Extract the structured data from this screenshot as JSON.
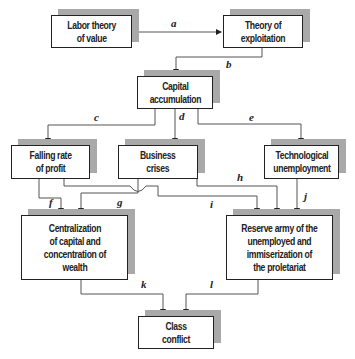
{
  "diagram": {
    "nodes": [
      {
        "id": "labor",
        "label": "Labor theory\nof value"
      },
      {
        "id": "exploitation",
        "label": "Theory of\nexploitation"
      },
      {
        "id": "capital",
        "label": "Capital\naccumulation"
      },
      {
        "id": "falling",
        "label": "Falling rate\nof profit"
      },
      {
        "id": "crises",
        "label": "Business\ncrises"
      },
      {
        "id": "tech",
        "label": "Technological\nunemployment"
      },
      {
        "id": "central",
        "label": "Centralization\nof capital and\nconcentration of\nwealth"
      },
      {
        "id": "reserve",
        "label": "Reserve army of the\nunemployed and\nimmiserization of\nthe proletariat"
      },
      {
        "id": "conflict",
        "label": "Class\nconflict"
      }
    ],
    "edges": [
      {
        "label": "a",
        "from": "labor",
        "to": "exploitation"
      },
      {
        "label": "b",
        "from": "exploitation",
        "to": "capital"
      },
      {
        "label": "c",
        "from": "capital",
        "to": "falling"
      },
      {
        "label": "d",
        "from": "capital",
        "to": "crises"
      },
      {
        "label": "e",
        "from": "capital",
        "to": "tech"
      },
      {
        "label": "f",
        "from": "falling",
        "to": "central"
      },
      {
        "label": "g",
        "from": "crises",
        "to": "central"
      },
      {
        "label": "h",
        "from": "crises",
        "to": "reserve"
      },
      {
        "label": "i",
        "from": "falling",
        "to": "reserve"
      },
      {
        "label": "j",
        "from": "tech",
        "to": "reserve"
      },
      {
        "label": "k",
        "from": "central",
        "to": "conflict"
      },
      {
        "label": "l",
        "from": "reserve",
        "to": "conflict"
      }
    ]
  },
  "colors": {
    "line": "#555555",
    "border": "#222222",
    "shadow": "#a9a9a9"
  }
}
